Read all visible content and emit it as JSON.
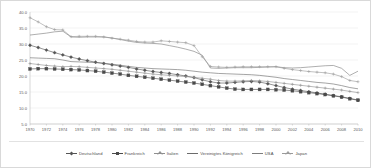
{
  "chart_data": {
    "type": "line",
    "title": "",
    "subtitle": "",
    "xlabel": "",
    "ylabel": "",
    "xlim": [
      1970,
      2010
    ],
    "ylim": [
      5.0,
      40.0
    ],
    "grid": true,
    "legend_position": "bottom",
    "ytick_labels": [
      "40.0",
      "35.0",
      "30.0",
      "25.0",
      "20.0",
      "15.0",
      "10.0",
      "5.0"
    ],
    "ytick_values": [
      40.0,
      35.0,
      30.0,
      25.0,
      20.0,
      15.0,
      10.0,
      5.0
    ],
    "xtick_labels": [
      "1970",
      "1972",
      "1974",
      "1976",
      "1978",
      "1980",
      "1982",
      "1984",
      "1986",
      "1988",
      "1990",
      "1992",
      "1994",
      "1996",
      "1998",
      "2000",
      "2002",
      "2004",
      "2006",
      "2008",
      "2010"
    ],
    "x": [
      1970,
      1971,
      1972,
      1973,
      1974,
      1975,
      1976,
      1977,
      1978,
      1979,
      1980,
      1981,
      1982,
      1983,
      1984,
      1985,
      1986,
      1987,
      1988,
      1989,
      1990,
      1991,
      1992,
      1993,
      1994,
      1995,
      1996,
      1997,
      1998,
      1999,
      2000,
      2001,
      2002,
      2003,
      2004,
      2005,
      2006,
      2007,
      2008,
      2009,
      2010
    ],
    "series": [
      {
        "name": "Deutschland",
        "color": "#555555",
        "marker": "diamond",
        "values": [
          29.6,
          28.9,
          28.1,
          27.3,
          26.6,
          25.9,
          25.3,
          24.8,
          24.3,
          23.9,
          23.5,
          23.1,
          22.7,
          22.2,
          21.8,
          21.4,
          21.1,
          20.8,
          20.4,
          20.0,
          19.5,
          18.8,
          18.2,
          17.8,
          17.8,
          18.0,
          18.2,
          18.3,
          18.1,
          17.6,
          17.0,
          16.4,
          15.9,
          15.5,
          15.1,
          14.7,
          14.3,
          13.9,
          13.5,
          13.0,
          12.5
        ]
      },
      {
        "name": "Frankreich",
        "color": "#4a4a4a",
        "marker": "square",
        "values": [
          22.2,
          22.3,
          22.3,
          22.2,
          22.1,
          22.0,
          21.9,
          21.7,
          21.5,
          21.2,
          20.9,
          20.6,
          20.2,
          19.9,
          19.6,
          19.3,
          19.0,
          18.7,
          18.4,
          18.1,
          17.8,
          17.4,
          17.0,
          16.6,
          16.2,
          15.9,
          15.8,
          15.8,
          15.8,
          15.8,
          15.7,
          15.6,
          15.4,
          15.1,
          14.8,
          14.5,
          14.2,
          13.8,
          13.4,
          12.9,
          12.4
        ]
      },
      {
        "name": "Italien",
        "color": "#8f8f8f",
        "marker": "cross",
        "values": [
          23.9,
          23.6,
          23.3,
          23.1,
          22.9,
          23.0,
          22.9,
          22.7,
          22.5,
          22.3,
          22.1,
          21.8,
          21.5,
          21.2,
          20.9,
          20.6,
          20.4,
          20.2,
          20.0,
          19.8,
          19.6,
          19.3,
          19.0,
          18.6,
          18.4,
          18.4,
          18.5,
          18.6,
          18.5,
          18.3,
          18.0,
          17.7,
          17.4,
          17.1,
          16.8,
          16.5,
          16.2,
          15.9,
          15.6,
          15.2,
          14.8
        ]
      },
      {
        "name": "Vereinigtes Königreich",
        "color": "#6b6b6b",
        "marker": "none",
        "values": [
          25.7,
          25.6,
          25.5,
          25.4,
          25.0,
          24.5,
          24.4,
          24.3,
          24.2,
          24.0,
          23.7,
          23.4,
          23.0,
          22.7,
          22.5,
          22.3,
          22.2,
          22.1,
          22.0,
          21.8,
          21.5,
          21.2,
          21.0,
          20.8,
          20.7,
          20.6,
          20.5,
          20.4,
          20.2,
          19.9,
          19.6,
          19.2,
          18.9,
          18.6,
          18.3,
          18.0,
          17.8,
          17.5,
          17.0,
          16.4,
          16.0
        ]
      },
      {
        "name": "USA",
        "color": "#7d7d7d",
        "marker": "none",
        "values": [
          32.8,
          33.1,
          33.4,
          33.8,
          34.0,
          32.2,
          32.1,
          32.2,
          32.2,
          32.2,
          31.9,
          31.4,
          30.9,
          30.5,
          30.3,
          30.2,
          30.0,
          29.5,
          29.0,
          28.4,
          27.7,
          26.5,
          22.5,
          22.4,
          22.5,
          22.6,
          22.6,
          22.6,
          22.7,
          22.8,
          22.9,
          22.6,
          22.5,
          22.6,
          22.8,
          23.0,
          23.2,
          23.3,
          22.4,
          20.2,
          21.5
        ]
      },
      {
        "name": "Japan",
        "color": "#9a9a9a",
        "marker": "cross",
        "values": [
          38.2,
          36.9,
          35.4,
          34.5,
          34.4,
          32.3,
          32.4,
          32.4,
          32.4,
          32.2,
          31.8,
          31.5,
          31.2,
          30.8,
          30.6,
          30.6,
          31.0,
          30.8,
          30.6,
          30.4,
          29.5,
          26.0,
          23.0,
          22.8,
          22.7,
          22.8,
          22.9,
          22.9,
          22.9,
          22.9,
          22.9,
          22.4,
          22.0,
          21.7,
          21.4,
          21.2,
          21.0,
          20.6,
          19.8,
          18.6,
          18.2
        ]
      }
    ]
  },
  "legend": {
    "items": [
      {
        "label": "Deutschland"
      },
      {
        "label": "Frankreich"
      },
      {
        "label": "Italien"
      },
      {
        "label": "Vereinigtes Königreich"
      },
      {
        "label": "USA"
      },
      {
        "label": "Japan"
      }
    ]
  }
}
